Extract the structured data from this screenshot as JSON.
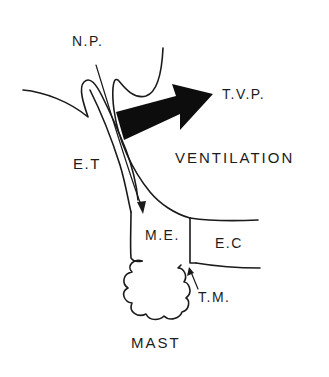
{
  "diagram": {
    "type": "anatomical schematic",
    "labels": {
      "np": "N.P.",
      "tvp": "T.V.P.",
      "et": "E.T",
      "ventilation": "VENTILATION",
      "me": "M.E.",
      "ec": "E.C",
      "tm": "T.M.",
      "mast": "MAST"
    },
    "colors": {
      "ink": "#1a1a1a",
      "background": "#ffffff"
    }
  }
}
